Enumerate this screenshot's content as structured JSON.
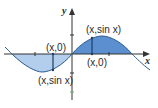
{
  "diagram": {
    "axes": {
      "x_label": "x",
      "y_label": "y"
    },
    "labels": {
      "left_axis_point": "(x,0)",
      "left_curve_point": "(x,sin x)",
      "right_curve_point": "(x,sin x)",
      "right_axis_point": "(x,0)"
    },
    "colors": {
      "curve": "#2b5d8e",
      "fill_positive": "#5b8fcf",
      "fill_negative": "#b3cdec",
      "axes": "#333333",
      "ticks": "#6fa77a"
    }
  }
}
